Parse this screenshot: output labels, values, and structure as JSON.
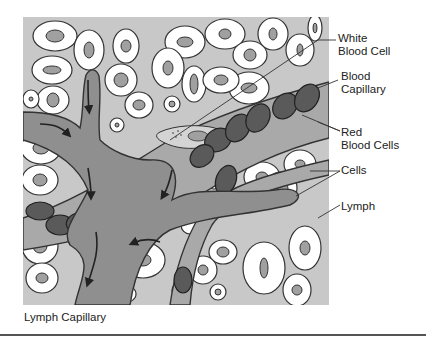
{
  "diagram": {
    "title": "Lymph Capillary",
    "labels": [
      {
        "id": "white-blood-cell",
        "text": "White\nBlood Cell"
      },
      {
        "id": "blood-capillary",
        "text": "Blood\nCapillary"
      },
      {
        "id": "red-blood-cells",
        "text": "Red\nBlood Cells"
      },
      {
        "id": "cells",
        "text": "Cells"
      },
      {
        "id": "lymph",
        "text": "Lymph"
      }
    ],
    "caption": "Lymph Capillary",
    "colors": {
      "interstitial_fluid": "#c8c8c8",
      "lymph_vessel": "#8f8f8f",
      "blood_capillary": "#a9a9a9",
      "red_blood_cell": "#5a5a5a",
      "tissue_cell": "#ffffff",
      "nucleus": "#a0a0a0",
      "outline": "#333333"
    }
  }
}
